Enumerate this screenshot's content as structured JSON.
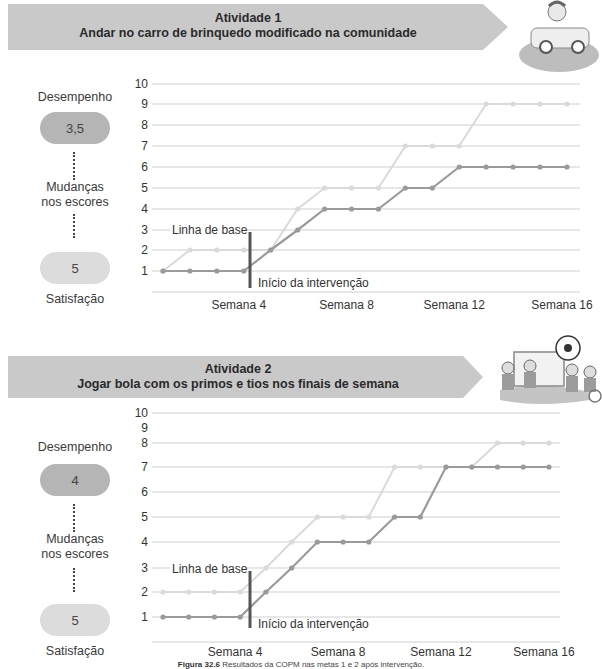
{
  "colors": {
    "banner": "#c9c9c9",
    "series_dark": "#9a9a9a",
    "series_light": "#dadada",
    "grid": "#cfcfcf",
    "marker": "#555555"
  },
  "activity1": {
    "banner_line1": "Atividade 1",
    "banner_line2": "Andar no carro de brinquedo modificado na comunidade",
    "illustration_icon": "boy-in-toy-car-icon",
    "side": {
      "performance_label": "Desempenho",
      "performance_value": "3,5",
      "change_label_1": "Mudanças",
      "change_label_2": "nos escores",
      "satisfaction_value": "5",
      "satisfaction_label": "Satisfação"
    }
  },
  "activity2": {
    "banner_line1": "Atividade 2",
    "banner_line2": "Jogar bola com os primos e tios nos finais de semana",
    "illustration_icon": "kids-playing-soccer-icon",
    "side": {
      "performance_label": "Desempenho",
      "performance_value": "4",
      "change_label_1": "Mudanças",
      "change_label_2": "nos escores",
      "satisfaction_value": "5",
      "satisfaction_label": "Satisfação"
    }
  },
  "caption": {
    "figure_label": "Figura 32.6",
    "text": " Resultados da COPM nas metas 1 e 2 após intervenção."
  },
  "chart_data": [
    {
      "type": "line",
      "title": "Atividade 1 — Andar no carro de brinquedo modificado na comunidade",
      "xlabel": "",
      "ylabel": "",
      "x": [
        1,
        2,
        3,
        4,
        5,
        6,
        7,
        8,
        9,
        10,
        11,
        12,
        13,
        14,
        15,
        16
      ],
      "x_tick_labels": [
        {
          "x": 4,
          "label": "Semana 4"
        },
        {
          "x": 8,
          "label": "Semana 8"
        },
        {
          "x": 12,
          "label": "Semana 12"
        },
        {
          "x": 16,
          "label": "Semana 16"
        }
      ],
      "y_ticks": [
        1,
        2,
        3,
        4,
        5,
        6,
        7,
        8,
        9,
        10
      ],
      "ylim": [
        0,
        10
      ],
      "grid": true,
      "series": [
        {
          "name": "Desempenho",
          "values": [
            1,
            1,
            1,
            1,
            2,
            3,
            4,
            4,
            4,
            5,
            5,
            6,
            6,
            6,
            6,
            6
          ]
        },
        {
          "name": "Satisfação",
          "values": [
            1,
            2,
            2,
            2,
            2,
            4,
            5,
            5,
            5,
            7,
            7,
            7,
            9,
            9,
            9,
            9
          ]
        }
      ],
      "annotations": [
        {
          "text": "Linha de base",
          "position": "before week 5, at y=3"
        },
        {
          "text": "Início da intervenção",
          "position": "vertical bar between week 4 and week 5"
        }
      ]
    },
    {
      "type": "line",
      "title": "Atividade 2 — Jogar bola com os primos e tios nos finais de semana",
      "xlabel": "",
      "ylabel": "",
      "x": [
        1,
        2,
        3,
        4,
        5,
        6,
        7,
        8,
        9,
        10,
        11,
        12,
        13,
        14,
        15,
        16
      ],
      "x_tick_labels": [
        {
          "x": 4,
          "label": "Semana 4"
        },
        {
          "x": 8,
          "label": "Semana 8"
        },
        {
          "x": 12,
          "label": "Semana 12"
        },
        {
          "x": 16,
          "label": "Semana 16"
        }
      ],
      "y_ticks": [
        1,
        2,
        3,
        4,
        5,
        6,
        7,
        8,
        9,
        10
      ],
      "ylim": [
        0,
        10
      ],
      "grid": true,
      "series": [
        {
          "name": "Desempenho",
          "values": [
            1,
            1,
            1,
            1,
            2,
            3,
            4,
            4,
            4,
            5,
            5,
            7,
            7,
            7,
            7,
            7
          ]
        },
        {
          "name": "Satisfação",
          "values": [
            2,
            2,
            2,
            2,
            3,
            4,
            5,
            5,
            5,
            7,
            7,
            7,
            7,
            8,
            8,
            8
          ]
        }
      ],
      "annotations": [
        {
          "text": "Linha de base",
          "position": "before week 5, at y=3"
        },
        {
          "text": "Início da intervenção",
          "position": "vertical bar between week 4 and week 5"
        }
      ]
    }
  ],
  "chart_layout": [
    {
      "x_start": 163,
      "x_step": 26.93,
      "grid_x0": 152,
      "grid_x1": 580,
      "y_pos": {
        "0": 292,
        "1": 271,
        "2": 250,
        "3": 230,
        "4": 209,
        "5": 188,
        "6": 167,
        "7": 146,
        "8": 125,
        "9": 104,
        "10": 84
      },
      "grid_levels": [
        0,
        1,
        2,
        3,
        4,
        5,
        6,
        7,
        8,
        9,
        10
      ],
      "label_levels": [
        1,
        2,
        3,
        4,
        5,
        6,
        7,
        8,
        9,
        10
      ],
      "marker_x": 250,
      "marker_y0": 232,
      "marker_y1": 288,
      "baseline_label_xy": [
        172,
        234
      ],
      "intervention_label_xy": [
        258,
        287
      ],
      "week_label_y": 309
    },
    {
      "x_start": 163,
      "x_step": 25.73,
      "grid_x0": 152,
      "grid_x1": 560,
      "y_pos": {
        "0": 642,
        "1": 617,
        "2": 592,
        "3": 568,
        "4": 542,
        "5": 517,
        "6": 492,
        "7": 467,
        "8": 443,
        "9": 428,
        "10": 413
      },
      "grid_levels": [
        0,
        1,
        2,
        3,
        4,
        5,
        6,
        7,
        8,
        10
      ],
      "label_levels": [
        1,
        2,
        3,
        4,
        5,
        6,
        7,
        8,
        9,
        10
      ],
      "marker_x": 250,
      "marker_y0": 571,
      "marker_y1": 628,
      "baseline_label_xy": [
        172,
        573
      ],
      "intervention_label_xy": [
        258,
        628
      ],
      "week_label_y": 656
    }
  ]
}
